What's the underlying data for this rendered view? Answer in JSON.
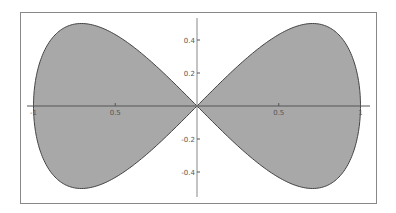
{
  "chart_data": {
    "type": "area",
    "title": "",
    "xlabel": "",
    "ylabel": "",
    "parametric": {
      "x": "sin(t)",
      "y": "sin(t)*cos(t)",
      "t_range": [
        0,
        6.2832
      ]
    },
    "x": [
      0,
      0.309,
      0.588,
      0.707,
      0.809,
      0.951,
      1.0,
      0.951,
      0.809,
      0.707,
      0.588,
      0.309,
      0,
      -0.309,
      -0.588,
      -0.707,
      -0.809,
      -0.951,
      -1.0,
      -0.951,
      -0.809,
      -0.707,
      -0.588,
      -0.309,
      0
    ],
    "y": [
      0,
      0.294,
      0.476,
      0.5,
      0.476,
      0.294,
      0,
      -0.294,
      -0.476,
      -0.5,
      -0.476,
      -0.294,
      0,
      0.294,
      0.476,
      0.5,
      0.476,
      0.294,
      0,
      -0.294,
      -0.476,
      -0.5,
      -0.476,
      -0.294,
      0
    ],
    "xlim": [
      -1.05,
      1.05
    ],
    "ylim": [
      -0.55,
      0.55
    ],
    "x_ticks": [
      {
        "value": -1,
        "label": "-1"
      },
      {
        "value": -0.5,
        "label": "0.5"
      },
      {
        "value": 0.5,
        "label": "0.5"
      },
      {
        "value": 1,
        "label": "1"
      }
    ],
    "y_ticks": [
      {
        "value": 0.4,
        "label": "0.4"
      },
      {
        "value": 0.2,
        "label": "0.2"
      },
      {
        "value": -0.2,
        "label": "-0.2"
      },
      {
        "value": -0.4,
        "label": "-0.4"
      }
    ],
    "grid": false,
    "legend": null,
    "colors": {
      "fill": "#a8a8a8",
      "stroke": "#444444",
      "axis": "#555555",
      "frame": "#888888"
    }
  }
}
